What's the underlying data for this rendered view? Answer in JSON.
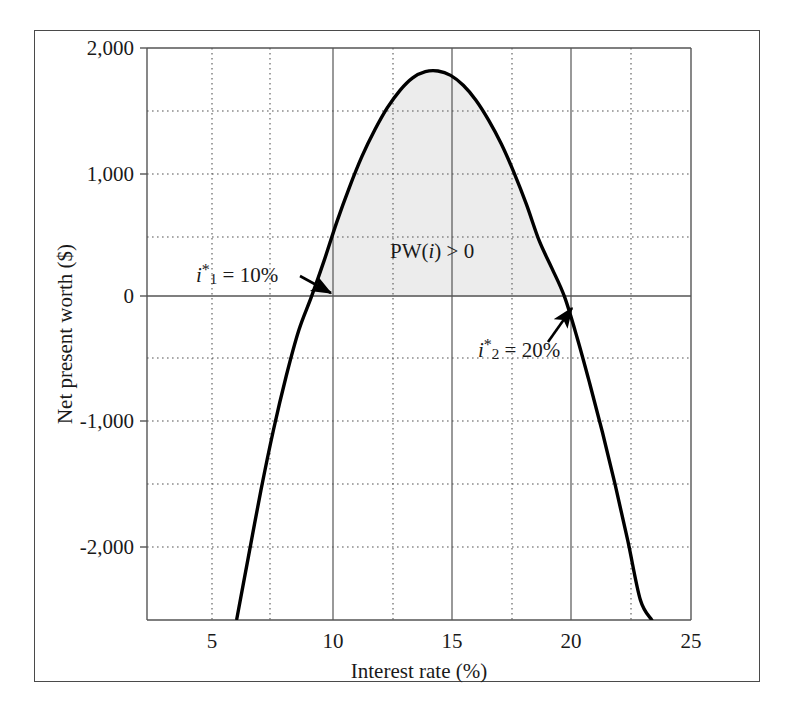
{
  "figure": {
    "background_color": "#ffffff",
    "frame_color": "#4a4a4a",
    "curve_color": "#000000",
    "shade_color": "#ececec",
    "grid_color": "#555555",
    "axis_color": "#555555"
  },
  "chart_data": {
    "type": "line",
    "title": "",
    "xlabel": "Interest rate (%)",
    "ylabel": "Net present worth ($)",
    "xlim": [
      3.5,
      25
    ],
    "ylim": [
      -2600,
      2000
    ],
    "xticks": [
      5,
      10,
      15,
      20,
      25
    ],
    "xtick_labels": [
      "5",
      "10",
      "15",
      "20",
      "25"
    ],
    "yticks": [
      -2000,
      -1000,
      0,
      1000,
      2000
    ],
    "ytick_labels": [
      "-2,000",
      "-1,000",
      "0",
      "1,000",
      "2,000"
    ],
    "x_minor_gridlines": [
      7.5,
      12.5,
      17.5,
      22.5
    ],
    "y_minor_gridlines": [
      -1500,
      -500,
      500,
      1500
    ],
    "grid": true,
    "legend": "none",
    "series": [
      {
        "name": "PW(i)",
        "x": [
          7.05,
          7.5,
          8.0,
          8.5,
          9.0,
          9.5,
          10.0,
          10.5,
          11.0,
          11.5,
          12.0,
          12.5,
          13.0,
          13.5,
          14.0,
          14.5,
          15.0,
          15.5,
          16.0,
          16.5,
          17.0,
          17.5,
          18.0,
          18.5,
          19.0,
          19.5,
          20.0,
          20.5,
          21.0,
          21.5,
          22.0,
          22.5,
          23.0,
          23.45
        ],
        "y": [
          -2590,
          -2100,
          -1560,
          -1070,
          -640,
          -270,
          0,
          290,
          600,
          880,
          1130,
          1340,
          1520,
          1660,
          1760,
          1810,
          1815,
          1780,
          1700,
          1580,
          1420,
          1230,
          1000,
          740,
          450,
          230,
          0,
          -330,
          -700,
          -1090,
          -1510,
          -1960,
          -2440,
          -2600
        ]
      }
    ],
    "shaded_region": {
      "label": "PW(i) > 0",
      "x_start": 10,
      "x_end": 20,
      "color": "#ececec"
    },
    "annotations": [
      {
        "id": "root-1",
        "text_italic": "i",
        "text_star": "*",
        "text_sub": "1",
        "text_rest": " = 10%",
        "full_text": "i*1 = 10%",
        "value": 10,
        "unit": "%",
        "text_x": 196,
        "text_y": 282,
        "arrow_from_x": 300,
        "arrow_from_y": 280,
        "arrow_to_x": 333,
        "arrow_to_y": 294
      },
      {
        "id": "root-2",
        "text_italic": "i",
        "text_star": "*",
        "text_sub": "2",
        "text_rest": " = 20%",
        "full_text": "i*2 = 20%",
        "value": 20,
        "unit": "%",
        "text_x": 478,
        "text_y": 352,
        "arrow_from_x": 552,
        "arrow_from_y": 338,
        "arrow_to_x": 573,
        "arrow_to_y": 305
      }
    ]
  }
}
